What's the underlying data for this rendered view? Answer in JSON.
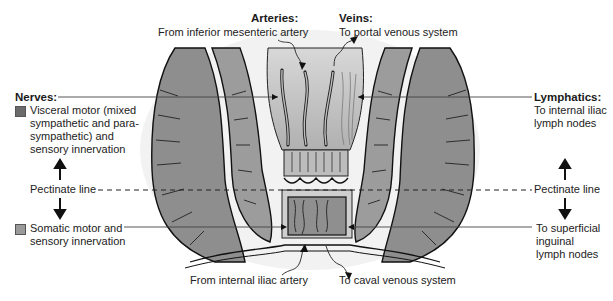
{
  "diagram": {
    "arteries": {
      "heading": "Arteries:",
      "upper": "From inferior mesenteric artery",
      "lower": "From internal iliac artery"
    },
    "veins": {
      "heading": "Veins:",
      "upper": "To portal venous system",
      "lower": "To caval venous system"
    },
    "nerves": {
      "heading": "Nerves:",
      "upper_lines": [
        "Visceral motor (mixed",
        "sympathetic and para-",
        "sympathetic) and",
        "sensory innervation"
      ],
      "lower_lines": [
        "Somatic motor and",
        "sensory innervation"
      ],
      "upper_swatch_color": "#6b6b6b",
      "lower_swatch_color": "#9a9a9a"
    },
    "lymphatics": {
      "heading": "Lymphatics:",
      "upper_lines": [
        "To internal iliac",
        "lymph nodes"
      ],
      "lower_lines": [
        "To superficial",
        "inguinal",
        "lymph nodes"
      ]
    },
    "pectinate": {
      "left": "Pectinate line",
      "right": "Pectinate line"
    }
  }
}
